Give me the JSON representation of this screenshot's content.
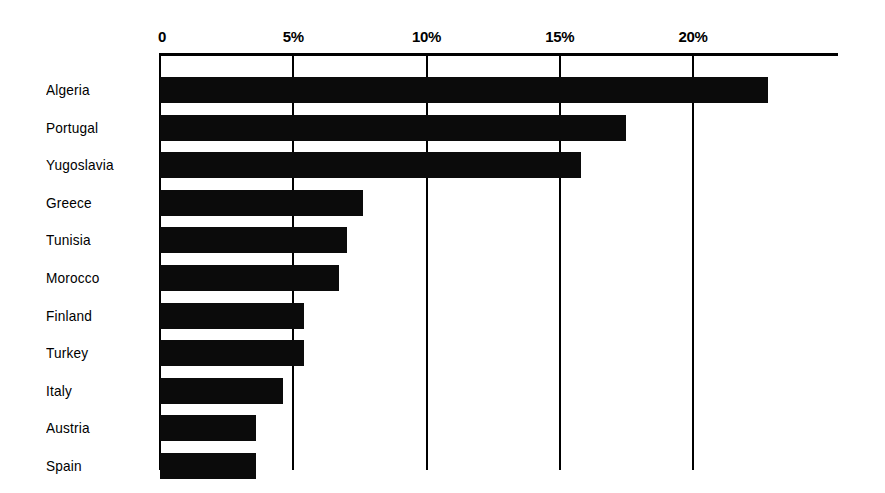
{
  "chart_data": {
    "type": "bar",
    "orientation": "horizontal",
    "title": "",
    "subtitle": "",
    "xlabel": "",
    "ylabel": "",
    "categories": [
      "Algeria",
      "Portugal",
      "Yugoslavia",
      "Greece",
      "Tunisia",
      "Morocco",
      "Finland",
      "Turkey",
      "Italy",
      "Austria",
      "Spain"
    ],
    "values": [
      22.8,
      17.5,
      15.8,
      7.6,
      7.0,
      6.7,
      5.4,
      5.4,
      4.6,
      3.6,
      3.6
    ],
    "value_unit": "%",
    "xlim": [
      0,
      26
    ],
    "xticks": [
      0,
      5,
      10,
      15,
      20
    ],
    "xtick_labels": [
      "0",
      "5%",
      "10%",
      "15%",
      "20%"
    ],
    "grid": "vertical",
    "legend": "none",
    "bar_color": "#0b0b0b",
    "background_color": "#ffffff",
    "axis_color": "#000000"
  },
  "geometry": {
    "axis_x0": 160,
    "px_per_unit": 26.65,
    "axis_top": 53,
    "plot_bottom": 470,
    "row_height": 37.6,
    "bar_height": 26,
    "axis_line_right": 838
  }
}
